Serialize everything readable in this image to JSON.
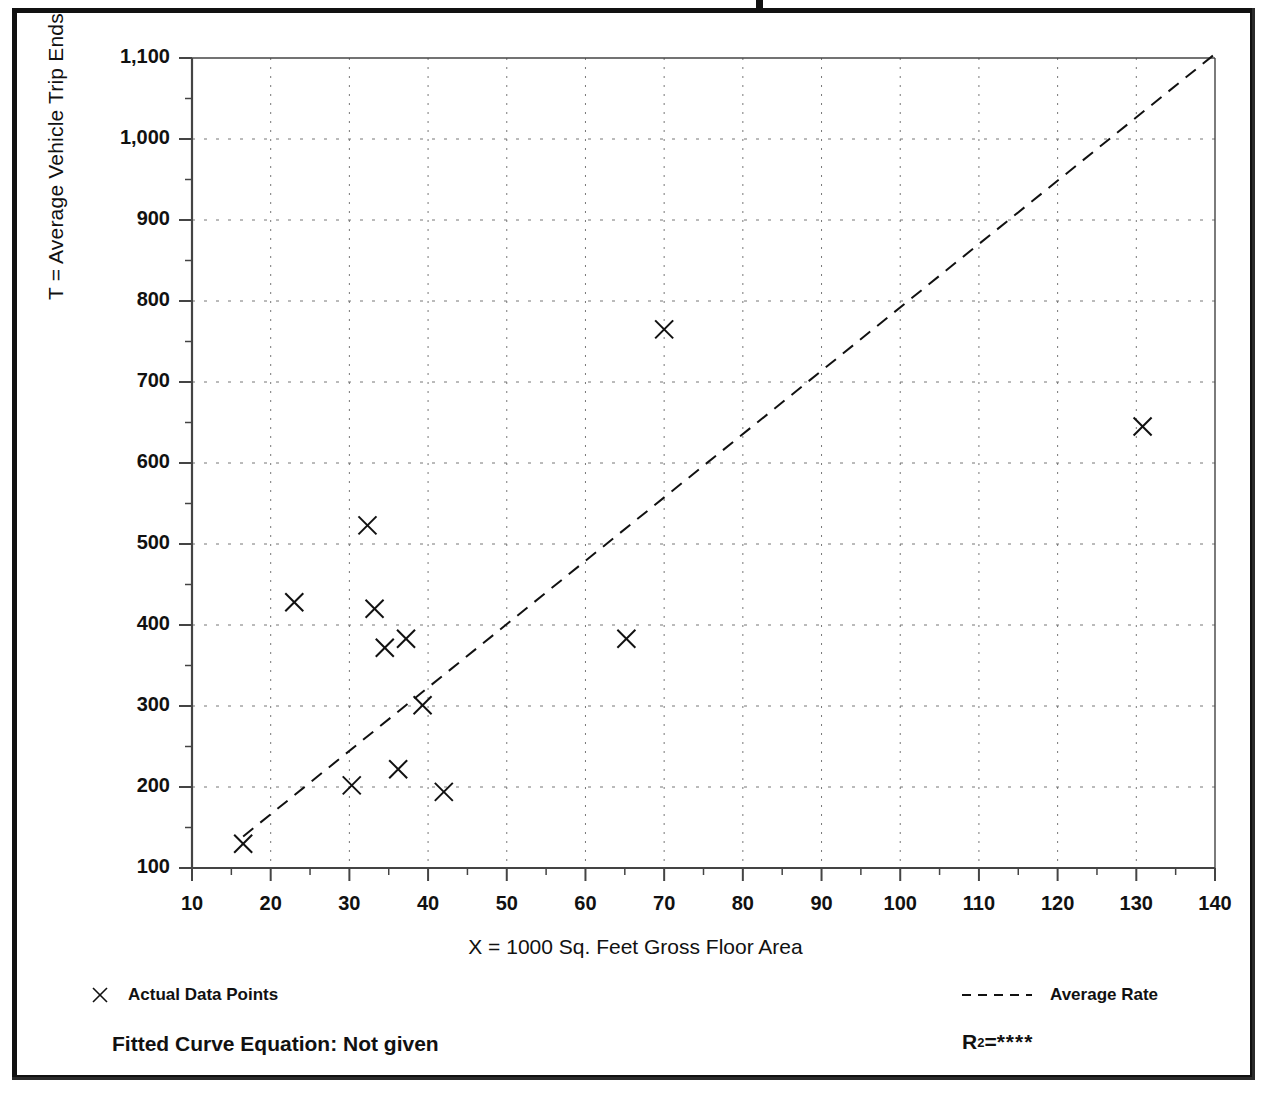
{
  "axes": {
    "y_title": "T = Average Vehicle Trip Ends",
    "x_title": "X = 1000 Sq. Feet Gross Floor Area",
    "y_ticks": [
      "1,100",
      "1,000",
      "900",
      "800",
      "700",
      "600",
      "500",
      "400",
      "300",
      "200",
      "100"
    ],
    "x_ticks": [
      "10",
      "20",
      "30",
      "40",
      "50",
      "60",
      "70",
      "80",
      "90",
      "100",
      "110",
      "120",
      "130",
      "140"
    ]
  },
  "legend": {
    "data_points_label": "Actual Data Points",
    "average_rate_label": "Average Rate",
    "marker_icon": "x-marker-icon",
    "line_icon": "dashed-line-icon"
  },
  "footer": {
    "equation_label": "Fitted Curve Equation:  Not given",
    "r2_prefix": "R",
    "r2_exponent": "2",
    "r2_equals": " = ",
    "r2_value": "****"
  },
  "colors": {
    "ink": "#111111",
    "grid": "#777777",
    "axis": "#444444"
  },
  "chart_data": {
    "type": "scatter",
    "title": "",
    "xlabel": "X = 1000 Sq. Feet Gross Floor Area",
    "ylabel": "T = Average Vehicle Trip Ends",
    "xlim": [
      10,
      140
    ],
    "ylim": [
      100,
      1100
    ],
    "xtick_step": 10,
    "ytick_step": 100,
    "minor_tick_step_x": 5,
    "minor_tick_step_y": 50,
    "grid": true,
    "grid_style": "dotted",
    "legend_position": "below-plot",
    "series": [
      {
        "name": "Actual Data Points",
        "type": "scatter",
        "marker": "x",
        "points": [
          {
            "x": 16.5,
            "y": 130
          },
          {
            "x": 23.0,
            "y": 428
          },
          {
            "x": 30.3,
            "y": 202
          },
          {
            "x": 32.3,
            "y": 523
          },
          {
            "x": 33.2,
            "y": 420
          },
          {
            "x": 34.5,
            "y": 372
          },
          {
            "x": 36.2,
            "y": 222
          },
          {
            "x": 37.2,
            "y": 383
          },
          {
            "x": 39.3,
            "y": 301
          },
          {
            "x": 42.0,
            "y": 194
          },
          {
            "x": 65.2,
            "y": 383
          },
          {
            "x": 70.0,
            "y": 765
          },
          {
            "x": 130.8,
            "y": 645
          }
        ]
      },
      {
        "name": "Average Rate",
        "type": "line",
        "style": "dashed",
        "points": [
          {
            "x": 16.5,
            "y": 139
          },
          {
            "x": 140.0,
            "y": 1105
          }
        ]
      }
    ]
  }
}
